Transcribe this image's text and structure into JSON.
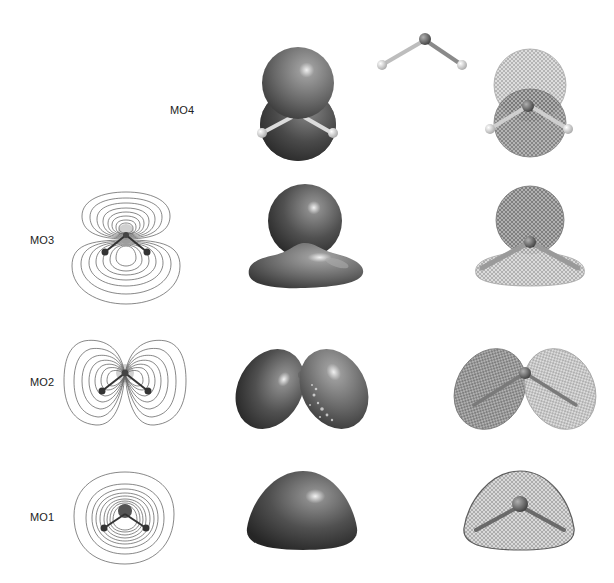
{
  "figure": {
    "columns": [
      "contour-plot",
      "solid-isosurface",
      "mesh-isosurface"
    ],
    "rows": [
      {
        "id": "MO4",
        "label": "MO4",
        "has_contour": false,
        "extra": "ball-and-stick water molecule"
      },
      {
        "id": "MO3",
        "label": "MO3",
        "has_contour": true
      },
      {
        "id": "MO2",
        "label": "MO2",
        "has_contour": true
      },
      {
        "id": "MO1",
        "label": "MO1",
        "has_contour": true
      }
    ]
  },
  "labels": {
    "mo4": "MO4",
    "mo3": "MO3",
    "mo2": "MO2",
    "mo1": "MO1"
  },
  "colors": {
    "background": "#ffffff",
    "surface_dark": "#3a3a3a",
    "surface_mid": "#6a6a6a",
    "contour_line": "#555555",
    "atom_h": "#e6e6e6",
    "atom_o": "#5a5a5a"
  }
}
